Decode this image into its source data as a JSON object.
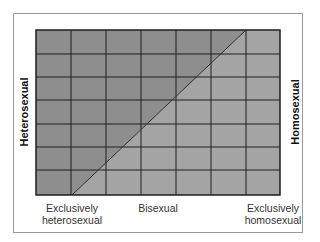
{
  "diagram": {
    "type": "continuum-grid",
    "left_label": "Heterosexual",
    "right_label": "Homosexual",
    "bottom_labels": {
      "left": [
        "Exclusively",
        "heterosexual"
      ],
      "middle": "Bisexual",
      "right": [
        "Exclusively",
        "homosexual"
      ]
    },
    "grid": {
      "columns": 7,
      "rows": 7
    },
    "diagonal": {
      "from": "bottom of column line 1",
      "to": "top of column line 6"
    },
    "colors": {
      "heterosexual_region": "#8e8e8e",
      "homosexual_region": "#a4a4a4",
      "grid_lines": "#1e1e1e",
      "frame": "#9a9a9a"
    }
  }
}
